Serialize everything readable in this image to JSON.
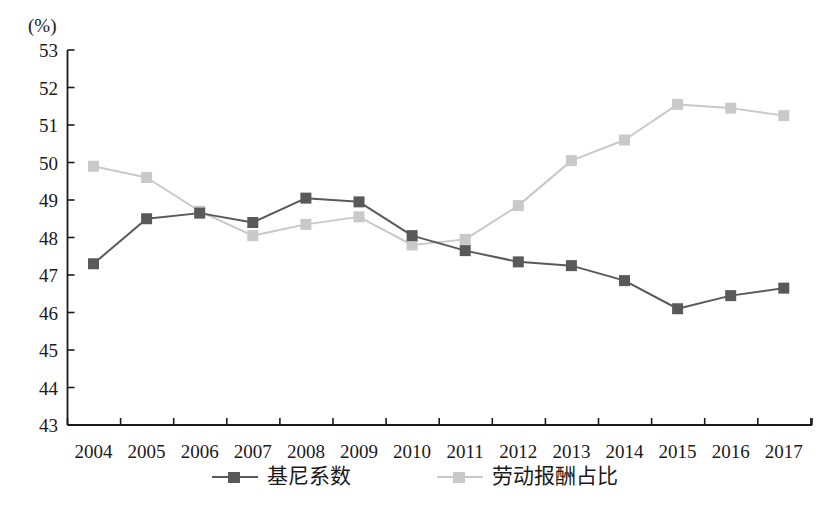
{
  "chart_data": {
    "type": "line",
    "title": "",
    "subtitle": "",
    "xlabel": "",
    "ylabel": "(%)",
    "unit_label": "(%)",
    "x": [
      "2004",
      "2005",
      "2006",
      "2007",
      "2008",
      "2009",
      "2010",
      "2011",
      "2012",
      "2013",
      "2014",
      "2015",
      "2016",
      "2017"
    ],
    "categories": [
      "2004",
      "2005",
      "2006",
      "2007",
      "2008",
      "2009",
      "2010",
      "2011",
      "2012",
      "2013",
      "2014",
      "2015",
      "2016",
      "2017"
    ],
    "series": [
      {
        "name": "基尼系数",
        "color": "#595959",
        "marker": "square",
        "values": [
          47.3,
          48.5,
          48.65,
          48.4,
          49.05,
          48.95,
          48.05,
          47.65,
          47.35,
          47.25,
          46.85,
          46.1,
          46.45,
          46.65
        ]
      },
      {
        "name": "劳动报酬占比",
        "color": "#c9c9c9",
        "marker": "square",
        "values": [
          49.9,
          49.6,
          48.7,
          48.05,
          48.35,
          48.55,
          47.8,
          47.95,
          48.85,
          50.05,
          50.6,
          51.55,
          51.45,
          51.25
        ]
      }
    ],
    "ylim": [
      43,
      53
    ],
    "ytick_values": [
      53,
      52,
      51,
      50,
      49,
      48,
      47,
      46,
      45,
      44,
      43
    ],
    "ytick_labels": [
      "53",
      "52",
      "51",
      "50",
      "49",
      "48",
      "47",
      "46",
      "45",
      "44",
      "43"
    ],
    "grid": false,
    "legend_position": "bottom",
    "legend": [
      "基尼系数",
      "劳动报酬占比"
    ],
    "axis_color": "#1a1a1a"
  }
}
